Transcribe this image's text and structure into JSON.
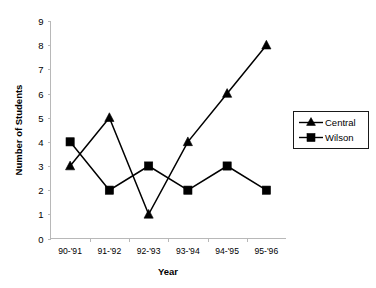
{
  "chart_data": {
    "type": "line",
    "title": "",
    "xlabel": "Year",
    "ylabel": "Number of Students",
    "categories": [
      "90-'91",
      "91-'92",
      "92-'93",
      "93-'94",
      "94-'95",
      "95-'96"
    ],
    "ylim": [
      0,
      9
    ],
    "yticks": [
      0,
      1,
      2,
      3,
      4,
      5,
      6,
      7,
      8,
      9
    ],
    "ytick_labels": [
      "0",
      "1",
      "2",
      "3",
      "4",
      "5",
      "6",
      "7",
      "8",
      "9"
    ],
    "grid": false,
    "legend_position": "right",
    "series": [
      {
        "name": "Central",
        "marker": "triangle",
        "color": "#000000",
        "values": [
          3,
          5,
          1,
          4,
          6,
          8
        ]
      },
      {
        "name": "Wilson",
        "marker": "square",
        "color": "#000000",
        "values": [
          4,
          2,
          3,
          2,
          3,
          2
        ]
      }
    ]
  },
  "legend": {
    "entries": [
      {
        "label": "Central"
      },
      {
        "label": "Wilson"
      }
    ]
  },
  "axes": {
    "y_title": "Number of Students",
    "x_title": "Year"
  }
}
